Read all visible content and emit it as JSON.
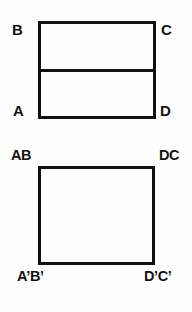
{
  "figure": {
    "background_color": "#fefefe",
    "line_color": "#111111",
    "label_color": "#121212",
    "line_width_px": 3
  },
  "top_figure": {
    "name": "divided-rectangle",
    "labels": {
      "top_left": "B",
      "top_right": "C",
      "bottom_left": "A",
      "bottom_right": "D"
    },
    "divider": {
      "orientation": "horizontal",
      "description": "interior horizontal segment splitting the rectangle"
    }
  },
  "bottom_figure": {
    "name": "folded-rectangle",
    "labels": {
      "top_left": "AB",
      "top_right": "DC",
      "bottom_left": "A’B’",
      "bottom_right": "D’C’"
    }
  }
}
